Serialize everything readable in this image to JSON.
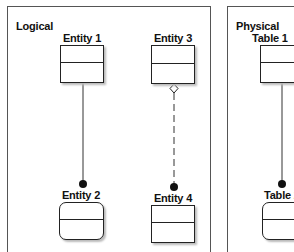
{
  "panels": [
    {
      "title": "Logical",
      "entities": [
        {
          "label": "Entity 1",
          "shape": "rect"
        },
        {
          "label": "Entity 2",
          "shape": "rounded"
        },
        {
          "label": "Entity 3",
          "shape": "rect"
        },
        {
          "label": "Entity 4",
          "shape": "rect"
        }
      ]
    },
    {
      "title": "Physical",
      "entities": [
        {
          "label": "Table 1",
          "shape": "rect"
        },
        {
          "label": "Table 2",
          "shape": "rounded"
        }
      ]
    }
  ],
  "connectors": [
    {
      "from": "Entity 1",
      "to": "Entity 2",
      "style": "solid",
      "start": "none",
      "end": "filled-dot"
    },
    {
      "from": "Entity 3",
      "to": "Entity 4",
      "style": "dashed",
      "start": "open-diamond",
      "end": "filled-dot"
    },
    {
      "from": "Table 1",
      "to": "Table 2",
      "style": "solid",
      "start": "none",
      "end": "filled-dot"
    }
  ],
  "colors": {
    "line": "#222222",
    "border": "#555555",
    "shadow": "#bbbbbb"
  }
}
